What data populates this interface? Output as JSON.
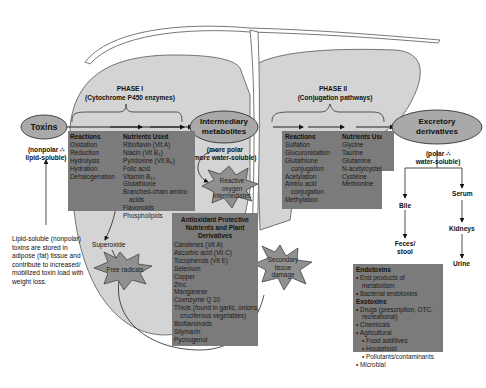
{
  "nodes": {
    "toxins": "Toxins",
    "toxins_note": [
      "(nonpolar ∴",
      "lipid-soluble)"
    ],
    "intermediary": [
      "Intermediary",
      "metabolites"
    ],
    "intermediary_note": [
      "(more polar",
      "more water-soluble)"
    ],
    "excretory": [
      "Excretory",
      "derivatives"
    ],
    "excretory_note": [
      "(polar ∴",
      "water-soluble)"
    ]
  },
  "phase1": {
    "title": "PHASE I",
    "subtitle": "(Cytochrome P450 enzymes)",
    "reactions_header": "Reactions",
    "reactions": [
      "Oxidation",
      "Reduction",
      "Hydrolysis",
      "Hydration",
      "Dehalogenation"
    ],
    "nutrients_header": "Nutrients Used",
    "nutrients": [
      "Riboflavin (Vit A)",
      "Niacin (Vit B₃)",
      "Pyridoxine (Vit B₆)",
      "Folic acid",
      "Vitamin B₁₂",
      "Glutathione",
      "Branched-chain amino",
      "acids",
      "Flavonoids",
      "Phospholipids"
    ]
  },
  "phase2": {
    "title": "PHASE II",
    "subtitle": "(Conjugation pathways)",
    "reactions_header": "Reactions",
    "reactions": [
      "Sulfation",
      "Glucuronidation",
      "Glutathione",
      "conjugation",
      "Acetylation",
      "Amino acid",
      "conjugation",
      "Methylation"
    ],
    "nutrients_header": "Nutrients Used",
    "nutrients": [
      "Glycine",
      "Taurine",
      "Glutamine",
      "N-acetylcysteine",
      "Cysteine",
      "Methionine"
    ]
  },
  "antioxidants": {
    "header": [
      "Antioxidant Protective",
      "Nutrients and Plant",
      "Derivatives"
    ],
    "items": [
      "Carotenes (Vit A)",
      "Ascorbic acid (Vit C)",
      "Tocopherols (Vit E)",
      "Selenium",
      "Copper",
      "Zinc",
      "Manganese",
      "Coenzyme Q 10",
      "Thiols (found in garlic, onions,",
      "cruciferous vegetables)",
      "Bioflavonoids",
      "Silymarin",
      "Pycnogenol"
    ]
  },
  "stars": {
    "reactive_oxygen": [
      "Reactive",
      "oxygen",
      "intermediates"
    ],
    "free_radicals": "Free radicals",
    "secondary_damage": [
      "Secondary",
      "tissue",
      "damage"
    ]
  },
  "labels": {
    "superoxide": "Superoxide",
    "lipid_note": [
      "Lipid-soluble (nonpolar)",
      "toxins are stored in",
      "adipose (fat) tissue and",
      "contribute to increased/",
      "mobilized toxin load with",
      "weight loss."
    ],
    "bile": "Bile",
    "feces": [
      "Feces/",
      "stool"
    ],
    "serum": "Serum",
    "kidneys": "Kidneys",
    "urine": "Urine"
  },
  "toxin_sources": {
    "endotoxins_header": "Endotoxins",
    "endotoxins": [
      "End products of",
      "metabolism",
      "Bacterial endotoxins"
    ],
    "exotoxins_header": "Exotoxins",
    "exotoxins": [
      "Drugs (prescription, OTC,",
      "recreational)",
      "Chemicals",
      "Agricultural",
      "Food additives",
      "Household",
      "Pollutants/contaminants",
      "Microbial"
    ]
  },
  "colors": {
    "liver_fill": "#d4d4d4",
    "box_fill": "#7b7b7b",
    "ellipse_fill": "#a9a9a9",
    "star_fill": "#909090"
  }
}
